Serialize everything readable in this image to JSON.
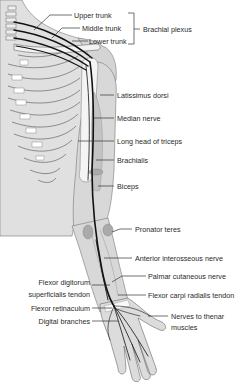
{
  "diagram": {
    "colors": {
      "background": "#ffffff",
      "skin": "#dcdcdc",
      "bone": "#f4f4f4",
      "muscle": "#c8c8c8",
      "nerve": "#111111",
      "outline": "#555555",
      "text": "#2a2a2a"
    },
    "labels": {
      "upper_trunk": "Upper trunk",
      "middle_trunk": "Middle trunk",
      "lower_trunk": "Lower trunk",
      "brachial_plexus": "Brachial plexus",
      "latissimus_dorsi": "Latissimus dorsi",
      "median_nerve": "Median nerve",
      "long_head_triceps": "Long head of triceps",
      "brachialis": "Brachialis",
      "biceps": "Biceps",
      "pronator_teres": "Pronator teres",
      "anterior_interosseous": "Anterior interosseous nerve",
      "palmar_cutaneous": "Palmar cutaneous nerve",
      "fds_tendon_1": "Flexor digitorum",
      "fds_tendon_2": "superficialis tendon",
      "fcr_tendon": "Flexor carpi radialis tendon",
      "flexor_retinaculum": "Flexor retinaculum",
      "thenar_1": "Nerves to thenar",
      "thenar_2": "muscles",
      "digital_branches": "Digital branches"
    }
  }
}
